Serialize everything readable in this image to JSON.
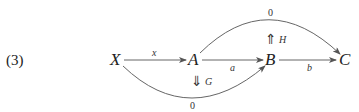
{
  "equation_number": "(3)",
  "nodes": {
    "X": "X",
    "A": "A",
    "B": "B",
    "C": "C"
  },
  "arrows": {
    "x": "x",
    "a": "a",
    "b": "b",
    "top_zero": "0",
    "bottom_zero": "0"
  },
  "twocells": {
    "H": {
      "symbol": "⇑",
      "label": "H"
    },
    "G": {
      "symbol": "⇓",
      "label": "G"
    }
  },
  "colors": {
    "line": "#555555",
    "text": "#222222"
  }
}
